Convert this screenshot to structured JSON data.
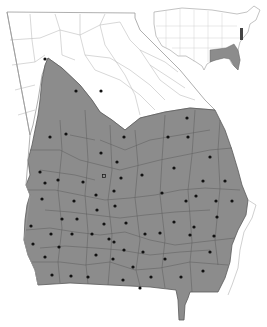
{
  "map": {
    "subject": "Georgia county distribution map",
    "colors": {
      "background": "#ffffff",
      "range_fill": "#8c8c8c",
      "county_border_outside": "#b8b8b8",
      "county_border_inside": "#5a5a5a",
      "state_outline": "#9a9a9a",
      "dot": "#111111"
    },
    "range_description": "Shaded area covers southern, central, and coastal Georgia (Coastal Plain and lower Piedmont); northern mountain counties unshaded.",
    "dots": [
      [
        45,
        59
      ],
      [
        76,
        91
      ],
      [
        101,
        91
      ],
      [
        50,
        137
      ],
      [
        66,
        134
      ],
      [
        124,
        137
      ],
      [
        168,
        137
      ],
      [
        188,
        137
      ],
      [
        187,
        118
      ],
      [
        101,
        153
      ],
      [
        117,
        162
      ],
      [
        210,
        157
      ],
      [
        40,
        172
      ],
      [
        45,
        183
      ],
      [
        58,
        180
      ],
      [
        83,
        182
      ],
      [
        121,
        178
      ],
      [
        142,
        175
      ],
      [
        174,
        168
      ],
      [
        203,
        181
      ],
      [
        225,
        181
      ],
      [
        42,
        199
      ],
      [
        74,
        201
      ],
      [
        96,
        195
      ],
      [
        114,
        191
      ],
      [
        162,
        193
      ],
      [
        186,
        201
      ],
      [
        196,
        196
      ],
      [
        216,
        201
      ],
      [
        232,
        201
      ],
      [
        97,
        210
      ],
      [
        115,
        206
      ],
      [
        62,
        219
      ],
      [
        77,
        219
      ],
      [
        31,
        226
      ],
      [
        104,
        224
      ],
      [
        126,
        223
      ],
      [
        174,
        222
      ],
      [
        194,
        227
      ],
      [
        217,
        217
      ],
      [
        51,
        234
      ],
      [
        72,
        234
      ],
      [
        92,
        234
      ],
      [
        145,
        234
      ],
      [
        160,
        233
      ],
      [
        190,
        235
      ],
      [
        214,
        236
      ],
      [
        33,
        244
      ],
      [
        59,
        247
      ],
      [
        109,
        239
      ],
      [
        114,
        242
      ],
      [
        124,
        250
      ],
      [
        143,
        252
      ],
      [
        165,
        259
      ],
      [
        210,
        252
      ],
      [
        45,
        257
      ],
      [
        96,
        255
      ],
      [
        113,
        259
      ],
      [
        133,
        267
      ],
      [
        203,
        271
      ],
      [
        52,
        275
      ],
      [
        71,
        276
      ],
      [
        88,
        277
      ],
      [
        151,
        277
      ],
      [
        181,
        277
      ],
      [
        123,
        280
      ],
      [
        140,
        288
      ]
    ],
    "hollow_dots": [
      [
        104,
        176
      ]
    ],
    "inset": {
      "label": "United States inset",
      "highlighted_region": "Southeastern US (Georgia, Alabama, Mississippi, Florida, Carolinas) and a Mid-Atlantic coastal strip"
    }
  }
}
